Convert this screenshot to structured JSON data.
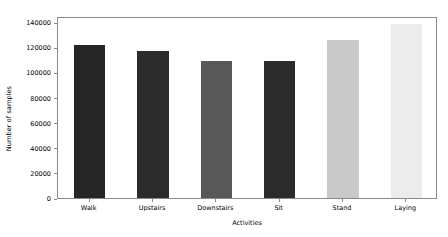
{
  "chart_data": {
    "type": "bar",
    "title": "",
    "xlabel": "Activities",
    "ylabel": "Number of samples",
    "categories": [
      "Walk",
      "Upstairs",
      "Downstairs",
      "Sit",
      "Stand",
      "Laying"
    ],
    "values": [
      122000,
      117000,
      109000,
      109000,
      126000,
      139000
    ],
    "bar_colors": [
      "#262626",
      "#2b2b2b",
      "#585858",
      "#2b2b2b",
      "#c9c9c9",
      "#ececec"
    ],
    "ylim": [
      0,
      145000
    ],
    "yticks": [
      0,
      20000,
      40000,
      60000,
      80000,
      100000,
      120000,
      140000
    ],
    "ytick_labels": [
      "0",
      "20000",
      "40000",
      "60000",
      "80000",
      "100000",
      "120000",
      "140000"
    ],
    "grid": false,
    "legend": false
  }
}
